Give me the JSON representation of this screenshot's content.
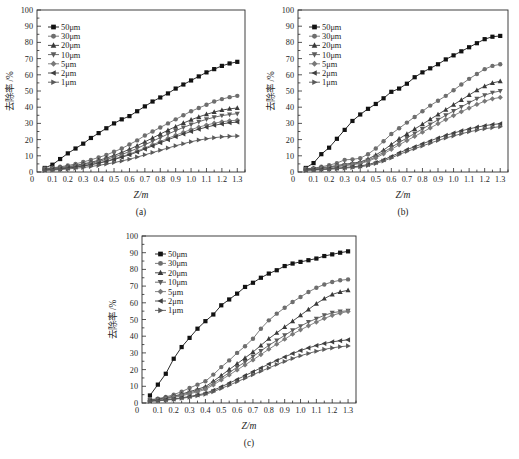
{
  "figure": {
    "background": "#ffffff",
    "panel_count": 3
  },
  "axes": {
    "xlabel": "Z/m",
    "ylabel": "去除率 /%",
    "xticks": [
      "0.1",
      "0.2",
      "0.3",
      "0.4",
      "0.5",
      "0.6",
      "0.7",
      "0.8",
      "0.9",
      "1.0",
      "1.1",
      "1.2",
      "1.3"
    ],
    "yticks": [
      "0",
      "10",
      "20",
      "30",
      "40",
      "50",
      "60",
      "70",
      "80",
      "90",
      "100"
    ],
    "xlim": [
      0.0,
      1.35
    ],
    "ylim": [
      0,
      100
    ],
    "grid": false
  },
  "legend": {
    "position": "upper-left",
    "entries": [
      {
        "label": "50μm",
        "marker": "square",
        "color": "#121212"
      },
      {
        "label": "30μm",
        "marker": "circle",
        "color": "#6e6e6e"
      },
      {
        "label": "20μm",
        "marker": "triangle-up",
        "color": "#3a3a3a"
      },
      {
        "label": "10μm",
        "marker": "triangle-down",
        "color": "#5c5c5c"
      },
      {
        "label": "5μm",
        "marker": "diamond",
        "color": "#787878"
      },
      {
        "label": "2μm",
        "marker": "triangle-left",
        "color": "#3f3f3f"
      },
      {
        "label": "1μm",
        "marker": "triangle-right",
        "color": "#595959"
      }
    ]
  },
  "panels": [
    {
      "id": "a",
      "caption": "(a)"
    },
    {
      "id": "b",
      "caption": "(b)"
    },
    {
      "id": "c",
      "caption": "(c)"
    }
  ],
  "chart_data": [
    {
      "type": "line",
      "panel": "(a)",
      "title": "",
      "xlabel": "Z/m",
      "ylabel": "去除率 /%",
      "xlim": [
        0.0,
        1.35
      ],
      "ylim": [
        0,
        100
      ],
      "grid": false,
      "legend_position": "upper-left",
      "x": [
        0.05,
        0.1,
        0.15,
        0.2,
        0.25,
        0.3,
        0.35,
        0.4,
        0.45,
        0.5,
        0.55,
        0.6,
        0.65,
        0.7,
        0.75,
        0.8,
        0.85,
        0.9,
        0.95,
        1.0,
        1.05,
        1.1,
        1.15,
        1.2,
        1.25,
        1.3
      ],
      "series": [
        {
          "name": "50μm",
          "marker": "square",
          "color": "#121212",
          "values": [
            2.5,
            4.5,
            8.0,
            11.5,
            14.5,
            17.5,
            21.0,
            24.0,
            27.0,
            30.0,
            32.5,
            34.5,
            37.5,
            40.5,
            43.5,
            46.0,
            48.5,
            51.5,
            54.0,
            56.5,
            59.0,
            61.5,
            63.5,
            65.5,
            67.0,
            68.0
          ]
        },
        {
          "name": "30μm",
          "marker": "circle",
          "color": "#6e6e6e",
          "values": [
            2.2,
            2.6,
            3.2,
            4.0,
            5.0,
            6.2,
            7.5,
            9.0,
            10.5,
            12.5,
            14.5,
            17.0,
            19.5,
            22.5,
            25.0,
            27.5,
            30.0,
            32.5,
            35.0,
            37.5,
            39.5,
            41.5,
            43.5,
            45.0,
            46.2,
            47.0
          ]
        },
        {
          "name": "20μm",
          "marker": "triangle-up",
          "color": "#3a3a3a",
          "values": [
            1.8,
            2.2,
            2.7,
            3.3,
            4.1,
            5.0,
            6.0,
            7.2,
            8.6,
            10.2,
            12.0,
            14.0,
            16.2,
            18.6,
            21.0,
            23.4,
            25.8,
            28.0,
            30.2,
            32.2,
            34.0,
            35.6,
            37.0,
            38.2,
            39.0,
            39.5
          ]
        },
        {
          "name": "10μm",
          "marker": "triangle-down",
          "color": "#5c5c5c",
          "values": [
            1.6,
            2.0,
            2.4,
            3.0,
            3.7,
            4.5,
            5.4,
            6.5,
            7.8,
            9.2,
            10.8,
            12.6,
            14.6,
            16.8,
            19.0,
            21.2,
            23.4,
            25.5,
            27.5,
            29.3,
            31.0,
            32.5,
            33.8,
            34.8,
            35.5,
            36.0
          ]
        },
        {
          "name": "5μm",
          "marker": "diamond",
          "color": "#787878",
          "values": [
            1.4,
            1.7,
            2.1,
            2.6,
            3.2,
            3.9,
            4.7,
            5.7,
            6.8,
            8.1,
            9.5,
            11.1,
            12.9,
            14.8,
            16.8,
            18.8,
            20.8,
            22.7,
            24.5,
            26.2,
            27.7,
            29.0,
            30.1,
            31.0,
            31.6,
            32.0
          ]
        },
        {
          "name": "2μm",
          "marker": "triangle-left",
          "color": "#3f3f3f",
          "values": [
            1.2,
            1.5,
            1.9,
            2.4,
            3.0,
            3.7,
            4.5,
            5.4,
            6.5,
            7.7,
            9.1,
            10.6,
            12.3,
            14.2,
            16.1,
            18.0,
            19.9,
            21.7,
            23.4,
            25.0,
            26.4,
            27.7,
            28.8,
            29.7,
            30.4,
            30.8
          ]
        },
        {
          "name": "1μm",
          "marker": "triangle-right",
          "color": "#595959",
          "values": [
            1.0,
            1.2,
            1.5,
            1.9,
            2.3,
            2.8,
            3.4,
            4.1,
            4.9,
            5.8,
            6.8,
            7.9,
            9.2,
            10.6,
            12.0,
            13.4,
            14.8,
            16.2,
            17.5,
            18.7,
            19.7,
            20.5,
            21.2,
            21.7,
            22.0,
            22.2
          ]
        }
      ]
    },
    {
      "type": "line",
      "panel": "(b)",
      "title": "",
      "xlabel": "Z/m",
      "ylabel": "去除率 /%",
      "xlim": [
        0.0,
        1.35
      ],
      "ylim": [
        0,
        100
      ],
      "grid": false,
      "legend_position": "upper-left",
      "x": [
        0.05,
        0.1,
        0.15,
        0.2,
        0.25,
        0.3,
        0.35,
        0.4,
        0.45,
        0.5,
        0.55,
        0.6,
        0.65,
        0.7,
        0.75,
        0.8,
        0.85,
        0.9,
        0.95,
        1.0,
        1.05,
        1.1,
        1.15,
        1.2,
        1.25,
        1.3
      ],
      "series": [
        {
          "name": "50μm",
          "marker": "square",
          "color": "#121212",
          "values": [
            2.5,
            5.5,
            11.0,
            15.0,
            20.5,
            26.0,
            31.5,
            35.5,
            39.0,
            42.0,
            45.5,
            49.5,
            51.5,
            54.5,
            58.5,
            61.5,
            64.0,
            66.5,
            69.5,
            72.0,
            74.5,
            77.0,
            79.5,
            82.0,
            83.5,
            84.0
          ]
        },
        {
          "name": "30μm",
          "marker": "circle",
          "color": "#6e6e6e",
          "values": [
            2.0,
            2.4,
            3.2,
            4.2,
            5.5,
            7.5,
            7.8,
            8.5,
            11.0,
            14.5,
            19.0,
            23.5,
            27.0,
            30.5,
            34.0,
            37.5,
            41.0,
            44.0,
            47.0,
            50.5,
            54.0,
            57.5,
            60.5,
            63.5,
            65.5,
            66.5
          ]
        },
        {
          "name": "20μm",
          "marker": "triangle-up",
          "color": "#3a3a3a",
          "values": [
            1.8,
            2.1,
            2.6,
            3.2,
            4.0,
            4.8,
            5.4,
            6.2,
            8.0,
            10.5,
            13.5,
            17.0,
            20.5,
            23.5,
            26.5,
            29.5,
            32.5,
            35.5,
            38.5,
            41.5,
            44.5,
            47.5,
            50.5,
            53.0,
            55.0,
            56.0
          ]
        },
        {
          "name": "10μm",
          "marker": "triangle-down",
          "color": "#5c5c5c",
          "values": [
            1.6,
            1.9,
            2.3,
            2.9,
            3.5,
            4.2,
            4.8,
            5.6,
            7.2,
            9.4,
            12.2,
            15.2,
            18.2,
            21.0,
            23.8,
            26.6,
            29.4,
            32.2,
            35.0,
            37.6,
            40.2,
            42.8,
            45.2,
            47.4,
            49.0,
            50.0
          ]
        },
        {
          "name": "5μm",
          "marker": "diamond",
          "color": "#787878",
          "values": [
            1.5,
            1.8,
            2.2,
            2.7,
            3.3,
            3.9,
            4.5,
            5.2,
            6.6,
            8.6,
            11.2,
            14.0,
            16.8,
            19.4,
            22.0,
            24.6,
            27.2,
            29.8,
            32.4,
            34.8,
            37.2,
            39.5,
            41.7,
            43.7,
            45.2,
            46.0
          ]
        },
        {
          "name": "2μm",
          "marker": "triangle-left",
          "color": "#3f3f3f",
          "values": [
            1.2,
            1.4,
            1.7,
            2.0,
            2.4,
            2.8,
            3.2,
            3.7,
            4.6,
            5.9,
            7.6,
            9.6,
            11.8,
            13.8,
            15.6,
            17.4,
            19.2,
            21.0,
            22.6,
            24.0,
            25.4,
            26.6,
            27.7,
            28.6,
            29.3,
            29.8
          ]
        },
        {
          "name": "1μm",
          "marker": "triangle-right",
          "color": "#595959",
          "values": [
            1.0,
            1.2,
            1.4,
            1.7,
            2.0,
            2.4,
            2.8,
            3.2,
            4.0,
            5.2,
            6.8,
            8.7,
            10.8,
            12.7,
            14.4,
            16.1,
            17.8,
            19.5,
            21.0,
            22.3,
            23.6,
            24.8,
            25.8,
            26.7,
            27.4,
            28.0
          ]
        }
      ]
    },
    {
      "type": "line",
      "panel": "(c)",
      "title": "",
      "xlabel": "Z/m",
      "ylabel": "去除率 /%",
      "xlim": [
        0.0,
        1.35
      ],
      "ylim": [
        0,
        100
      ],
      "grid": false,
      "legend_position": "upper-left",
      "x": [
        0.05,
        0.1,
        0.15,
        0.2,
        0.25,
        0.3,
        0.35,
        0.4,
        0.45,
        0.5,
        0.55,
        0.6,
        0.65,
        0.7,
        0.75,
        0.8,
        0.85,
        0.9,
        0.95,
        1.0,
        1.05,
        1.1,
        1.15,
        1.2,
        1.25,
        1.3
      ],
      "series": [
        {
          "name": "50μm",
          "marker": "square",
          "color": "#121212",
          "values": [
            4.5,
            11.0,
            17.5,
            26.5,
            33.5,
            39.0,
            44.5,
            49.0,
            53.0,
            58.5,
            62.0,
            65.5,
            69.5,
            72.0,
            75.0,
            77.5,
            79.5,
            82.0,
            83.5,
            84.5,
            85.5,
            86.5,
            88.0,
            89.0,
            90.0,
            90.8
          ]
        },
        {
          "name": "30μm",
          "marker": "circle",
          "color": "#6e6e6e",
          "values": [
            2.0,
            2.6,
            3.6,
            5.0,
            6.8,
            9.0,
            11.0,
            13.0,
            17.0,
            21.5,
            25.5,
            30.0,
            34.0,
            38.5,
            44.5,
            49.5,
            53.5,
            57.0,
            60.5,
            63.5,
            66.5,
            69.0,
            71.0,
            72.5,
            73.5,
            74.0
          ]
        },
        {
          "name": "20μm",
          "marker": "triangle-up",
          "color": "#3a3a3a",
          "values": [
            1.8,
            2.3,
            3.1,
            4.1,
            5.3,
            6.8,
            8.2,
            9.8,
            13.0,
            16.5,
            20.0,
            23.5,
            27.0,
            30.5,
            34.5,
            38.5,
            42.0,
            45.5,
            49.0,
            52.5,
            56.0,
            59.5,
            62.5,
            65.0,
            66.5,
            67.5
          ]
        },
        {
          "name": "10μm",
          "marker": "triangle-down",
          "color": "#5c5c5c",
          "values": [
            1.6,
            2.1,
            2.8,
            3.7,
            4.8,
            6.1,
            7.4,
            8.9,
            11.8,
            15.0,
            18.2,
            21.4,
            24.6,
            27.8,
            31.2,
            34.5,
            37.5,
            40.5,
            43.5,
            46.0,
            48.5,
            50.5,
            52.5,
            54.0,
            54.8,
            55.2
          ]
        },
        {
          "name": "5μm",
          "marker": "diamond",
          "color": "#787878",
          "values": [
            1.5,
            1.9,
            2.5,
            3.3,
            4.3,
            5.5,
            6.7,
            8.1,
            10.8,
            13.8,
            16.8,
            19.8,
            22.8,
            25.8,
            29.0,
            32.2,
            35.2,
            38.2,
            41.2,
            43.8,
            46.2,
            48.5,
            50.6,
            52.5,
            53.8,
            54.8
          ]
        },
        {
          "name": "2μm",
          "marker": "triangle-left",
          "color": "#3f3f3f",
          "values": [
            1.2,
            1.5,
            1.9,
            2.4,
            3.1,
            3.9,
            4.8,
            5.8,
            7.6,
            9.7,
            11.9,
            14.1,
            16.4,
            18.7,
            21.0,
            23.3,
            25.5,
            27.6,
            29.6,
            31.4,
            33.0,
            34.4,
            35.6,
            36.6,
            37.3,
            37.8
          ]
        },
        {
          "name": "1μm",
          "marker": "triangle-right",
          "color": "#595959",
          "values": [
            1.0,
            1.3,
            1.7,
            2.2,
            2.8,
            3.5,
            4.3,
            5.2,
            6.8,
            8.7,
            10.7,
            12.7,
            14.8,
            16.9,
            19.0,
            21.0,
            23.0,
            24.9,
            26.7,
            28.3,
            29.7,
            31.0,
            32.1,
            33.0,
            33.7,
            34.2
          ]
        }
      ]
    }
  ]
}
